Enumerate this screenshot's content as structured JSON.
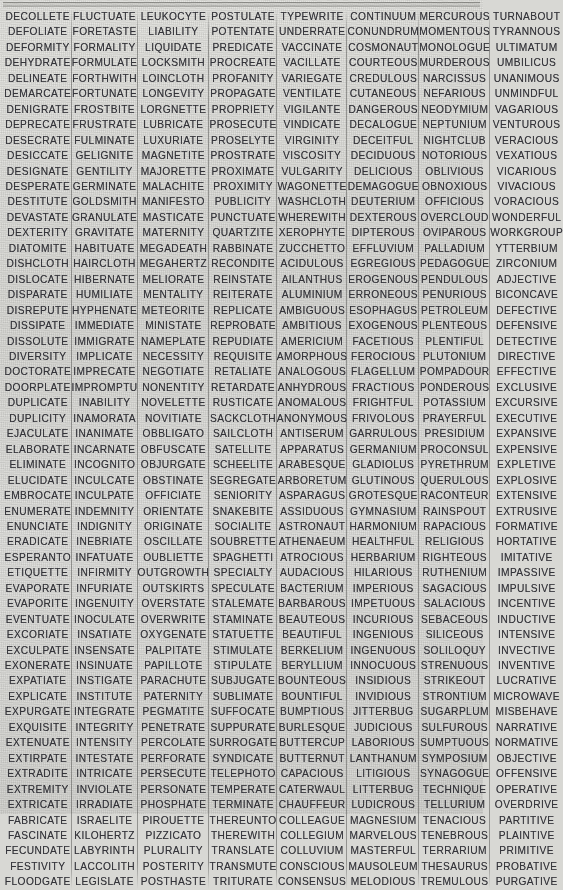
{
  "document": {
    "type": "word-list-table",
    "columns_count": 8,
    "rows_count": 52,
    "top_rule": true,
    "text_color": "#34343a",
    "paper_color": "#d9d9d5",
    "separator_color": "#5a5a58"
  },
  "columns": [
    {
      "index": 0,
      "words": [
        "DECOLLETE",
        "DEFOLIATE",
        "DEFORMITY",
        "DEHYDRATE",
        "DELINEATE",
        "DEMARCATE",
        "DENIGRATE",
        "DEPRECATE",
        "DESECRATE",
        "DESICCATE",
        "DESIGNATE",
        "DESPERATE",
        "DESTITUTE",
        "DEVASTATE",
        "DEXTERITY",
        "DIATOMITE",
        "DISHCLOTH",
        "DISLOCATE",
        "DISPARATE",
        "DISREPUTE",
        "DISSIPATE",
        "DISSOLUTE",
        "DIVERSITY",
        "DOCTORATE",
        "DOORPLATE",
        "DUPLICATE",
        "DUPLICITY",
        "EJACULATE",
        "ELABORATE",
        "ELIMINATE",
        "ELUCIDATE",
        "EMBROCATE",
        "ENUMERATE",
        "ENUNCIATE",
        "ERADICATE",
        "ESPERANTO",
        "ETIQUETTE",
        "EVAPORATE",
        "EVAPORITE",
        "EVENTUATE",
        "EXCORIATE",
        "EXCULPATE",
        "EXONERATE",
        "EXPATIATE",
        "EXPLICATE",
        "EXPURGATE",
        "EXQUISITE",
        "EXTENUATE",
        "EXTIRPATE",
        "EXTRADITE",
        "EXTREMITY",
        "EXTRICATE",
        "FABRICATE",
        "FASCINATE",
        "FECUNDATE",
        "FESTIVITY",
        "FLOODGATE"
      ]
    },
    {
      "index": 1,
      "words": [
        "FLUCTUATE",
        "FORETASTE",
        "FORMALITY",
        "FORMULATE",
        "FORTHWITH",
        "FORTUNATE",
        "FROSTBITE",
        "FRUSTRATE",
        "FULMINATE",
        "GELIGNITE",
        "GENTILITY",
        "GERMINATE",
        "GOLDSMITH",
        "GRANULATE",
        "GRAVITATE",
        "HABITUATE",
        "HAIRCLOTH",
        "HIBERNATE",
        "HUMILIATE",
        "HYPHENATE",
        "IMMEDIATE",
        "IMMIGRATE",
        "IMPLICATE",
        "IMPRECATE",
        "IMPROMPTU",
        "INABILITY",
        "INAMORATA",
        "INANIMATE",
        "INCARNATE",
        "INCOGNITO",
        "INCULCATE",
        "INCULPATE",
        "INDEMNITY",
        "INDIGNITY",
        "INEBRIATE",
        "INFATUATE",
        "INFIRMITY",
        "INFURIATE",
        "INGENUITY",
        "INOCULATE",
        "INSATIATE",
        "INSENSATE",
        "INSINUATE",
        "INSTIGATE",
        "INSTITUTE",
        "INTEGRATE",
        "INTEGRITY",
        "INTENSITY",
        "INTESTATE",
        "INTRICATE",
        "INVIOLATE",
        "IRRADIATE",
        "ISRAELITE",
        "KILOHERTZ",
        "LABYRINTH",
        "LACCOLITH",
        "LEGISLATE"
      ]
    },
    {
      "index": 2,
      "words": [
        "LEUKOCYTE",
        "LIABILITY",
        "LIQUIDATE",
        "LOCKSMITH",
        "LOINCLOTH",
        "LONGEVITY",
        "LORGNETTE",
        "LUBRICATE",
        "LUXURIATE",
        "MAGNETITE",
        "MAJORETTE",
        "MALACHITE",
        "MANIFESTO",
        "MASTICATE",
        "MATERNITY",
        "MEGADEATH",
        "MEGAHERTZ",
        "MELIORATE",
        "MENTALITY",
        "METEORITE",
        "MINISTATE",
        "NAMEPLATE",
        "NECESSITY",
        "NEGOTIATE",
        "NONENTITY",
        "NOVELETTE",
        "NOVITIATE",
        "OBBLIGATO",
        "OBFUSCATE",
        "OBJURGATE",
        "OBSTINATE",
        "OFFICIATE",
        "ORIENTATE",
        "ORIGINATE",
        "OSCILLATE",
        "OUBLIETTE",
        "OUTGROWTH",
        "OUTSKIRTS",
        "OVERSTATE",
        "OVERWRITE",
        "OXYGENATE",
        "PALPITATE",
        "PAPILLOTE",
        "PARACHUTE",
        "PATERNITY",
        "PEGMATITE",
        "PENETRATE",
        "PERCOLATE",
        "PERFORATE",
        "PERSECUTE",
        "PERSONATE",
        "PHOSPHATE",
        "PIROUETTE",
        "PIZZICATO",
        "PLURALITY",
        "POSTERITY",
        "POSTHASTE"
      ]
    },
    {
      "index": 3,
      "words": [
        "POSTULATE",
        "POTENTATE",
        "PREDICATE",
        "PROCREATE",
        "PROFANITY",
        "PROPAGATE",
        "PROPRIETY",
        "PROSECUTE",
        "PROSELYTE",
        "PROSTRATE",
        "PROXIMATE",
        "PROXIMITY",
        "PUBLICITY",
        "PUNCTUATE",
        "QUARTZITE",
        "RABBINATE",
        "RECONDITE",
        "REINSTATE",
        "REITERATE",
        "REPLICATE",
        "REPROBATE",
        "REPUDIATE",
        "REQUISITE",
        "RETALIATE",
        "RETARDATE",
        "RUSTICATE",
        "SACKCLOTH",
        "SAILCLOTH",
        "SATELLITE",
        "SCHEELITE",
        "SEGREGATE",
        "SENIORITY",
        "SNAKEBITE",
        "SOCIALITE",
        "SOUBRETTE",
        "SPAGHETTI",
        "SPECIALTY",
        "SPECULATE",
        "STALEMATE",
        "STAMINATE",
        "STATUETTE",
        "STIMULATE",
        "STIPULATE",
        "SUBJUGATE",
        "SUBLIMATE",
        "SUFFOCATE",
        "SUPPURATE",
        "SURROGATE",
        "SYNDICATE",
        "TELEPHOTO",
        "TEMPERATE",
        "TERMINATE",
        "THEREUNTO",
        "THEREWITH",
        "TRANSLATE",
        "TRANSMUTE",
        "TRITURATE"
      ]
    },
    {
      "index": 4,
      "words": [
        "TYPEWRITE",
        "UNDERRATE",
        "VACCINATE",
        "VACILLATE",
        "VARIEGATE",
        "VENTILATE",
        "VIGILANTE",
        "VINDICATE",
        "VIRGINITY",
        "VISCOSITY",
        "VULGARITY",
        "WAGONETTE",
        "WASHCLOTH",
        "WHEREWITH",
        "XEROPHYTE",
        "ZUCCHETTO",
        "ACIDULOUS",
        "AILANTHUS",
        "ALUMINIUM",
        "AMBIGUOUS",
        "AMBITIOUS",
        "AMERICIUM",
        "AMORPHOUS",
        "ANALOGOUS",
        "ANHYDROUS",
        "ANOMALOUS",
        "ANONYMOUS",
        "ANTISERUM",
        "APPARATUS",
        "ARABESQUE",
        "ARBORETUM",
        "ASPARAGUS",
        "ASSIDUOUS",
        "ASTRONAUT",
        "ATHENAEUM",
        "ATROCIOUS",
        "AUDACIOUS",
        "BACTERIUM",
        "BARBAROUS",
        "BEAUTEOUS",
        "BEAUTIFUL",
        "BERKELIUM",
        "BERYLLIUM",
        "BOUNTEOUS",
        "BOUNTIFUL",
        "BUMPTIOUS",
        "BURLESQUE",
        "BUTTERCUP",
        "BUTTERNUT",
        "CAPACIOUS",
        "CATERWAUL",
        "CHAUFFEUR",
        "COLLEAGUE",
        "COLLEGIUM",
        "COLLUVIUM",
        "CONSCIOUS",
        "CONSENSUS"
      ]
    },
    {
      "index": 5,
      "words": [
        "CONTINUUM",
        "CONUNDRUM",
        "COSMONAUT",
        "COURTEOUS",
        "CREDULOUS",
        "CUTANEOUS",
        "DANGEROUS",
        "DECALOGUE",
        "DECEITFUL",
        "DECIDUOUS",
        "DELICIOUS",
        "DEMAGOGUE",
        "DEUTERIUM",
        "DEXTEROUS",
        "DIPTEROUS",
        "EFFLUVIUM",
        "EGREGIOUS",
        "EROGENOUS",
        "ERRONEOUS",
        "ESOPHAGUS",
        "EXOGENOUS",
        "FACETIOUS",
        "FEROCIOUS",
        "FLAGELLUM",
        "FRACTIOUS",
        "FRIGHTFUL",
        "FRIVOLOUS",
        "GARRULOUS",
        "GERMANIUM",
        "GLADIOLUS",
        "GLUTINOUS",
        "GROTESQUE",
        "GYMNASIUM",
        "HARMONIUM",
        "HEALTHFUL",
        "HERBARIUM",
        "HILARIOUS",
        "IMPERIOUS",
        "IMPETUOUS",
        "INCURIOUS",
        "INGENIOUS",
        "INGENUOUS",
        "INNOCUOUS",
        "INSIDIOUS",
        "INVIDIOUS",
        "JITTERBUG",
        "JUDICIOUS",
        "LABORIOUS",
        "LANTHANUM",
        "LITIGIOUS",
        "LITTERBUG",
        "LUDICROUS",
        "MAGNESIUM",
        "MARVELOUS",
        "MASTERFUL",
        "MAUSOLEUM",
        "MELODIOUS"
      ]
    },
    {
      "index": 6,
      "words": [
        "MERCUROUS",
        "MOMENTOUS",
        "MONOLOGUE",
        "MURDEROUS",
        "NARCISSUS",
        "NEFARIOUS",
        "NEODYMIUM",
        "NEPTUNIUM",
        "NIGHTCLUB",
        "NOTORIOUS",
        "OBLIVIOUS",
        "OBNOXIOUS",
        "OFFICIOUS",
        "OVERCLOUD",
        "OVIPAROUS",
        "PALLADIUM",
        "PEDAGOGUE",
        "PENDULOUS",
        "PENURIOUS",
        "PETROLEUM",
        "PLENTEOUS",
        "PLENTIFUL",
        "PLUTONIUM",
        "POMPADOUR",
        "PONDEROUS",
        "POTASSIUM",
        "PRAYERFUL",
        "PRESIDIUM",
        "PROCONSUL",
        "PYRETHRUM",
        "QUERULOUS",
        "RACONTEUR",
        "RAINSPOUT",
        "RAPACIOUS",
        "RELIGIOUS",
        "RIGHTEOUS",
        "RUTHENIUM",
        "SAGACIOUS",
        "SALACIOUS",
        "SEBACEOUS",
        "SILICEOUS",
        "SOLILOQUY",
        "STRENUOUS",
        "STRIKEOUT",
        "STRONTIUM",
        "SUGARPLUM",
        "SULFUROUS",
        "SUMPTUOUS",
        "SYMPOSIUM",
        "SYNAGOGUE",
        "TECHNIQUE",
        "TELLURIUM",
        "TENACIOUS",
        "TENEBROUS",
        "TERRARIUM",
        "THESAURUS",
        "TREMULOUS"
      ]
    },
    {
      "index": 7,
      "words": [
        "TURNABOUT",
        "TYRANNOUS",
        "ULTIMATUM",
        "UMBILICUS",
        "UNANIMOUS",
        "UNMINDFUL",
        "VAGARIOUS",
        "VENTUROUS",
        "VERACIOUS",
        "VEXATIOUS",
        "VICARIOUS",
        "VIVACIOUS",
        "VORACIOUS",
        "WONDERFUL",
        "WORKGROUP",
        "YTTERBIUM",
        "ZIRCONIUM",
        "ADJECTIVE",
        "BICONCAVE",
        "DEFECTIVE",
        "DEFENSIVE",
        "DETECTIVE",
        "DIRECTIVE",
        "EFFECTIVE",
        "EXCLUSIVE",
        "EXCURSIVE",
        "EXECUTIVE",
        "EXPANSIVE",
        "EXPENSIVE",
        "EXPLETIVE",
        "EXPLOSIVE",
        "EXTENSIVE",
        "EXTRUSIVE",
        "FORMATIVE",
        "HORTATIVE",
        "IMITATIVE",
        "IMPASSIVE",
        "IMPULSIVE",
        "INCENTIVE",
        "INDUCTIVE",
        "INTENSIVE",
        "INVECTIVE",
        "INVENTIVE",
        "LUCRATIVE",
        "MICROWAVE",
        "MISBEHAVE",
        "NARRATIVE",
        "NORMATIVE",
        "OBJECTIVE",
        "OFFENSIVE",
        "OPERATIVE",
        "OVERDRIVE",
        "PARTITIVE",
        "PLAINTIVE",
        "PRIMITIVE",
        "PROBATIVE",
        "PURGATIVE"
      ]
    }
  ]
}
